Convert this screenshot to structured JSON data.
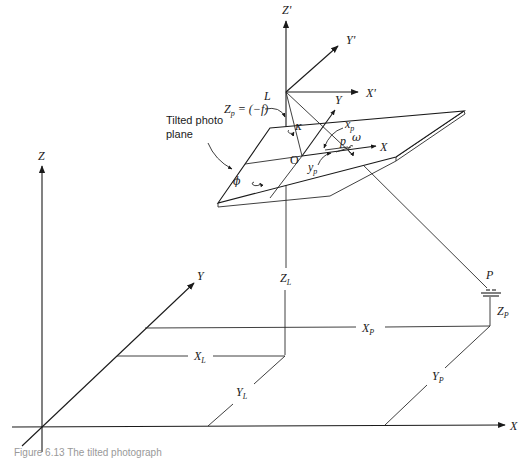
{
  "figure": {
    "callout_label_line1": "Tilted photo",
    "callout_label_line2": "plane",
    "caption": "Figure 6.13  The tilted photograph"
  },
  "ground_axes": {
    "x_label": "X",
    "y_label": "Y",
    "z_label": "Z"
  },
  "camera_axes": {
    "perspective_center": "L",
    "x_prime_label": "X'",
    "y_prime_label": "Y'",
    "z_prime_label": "Z'"
  },
  "photo_plane": {
    "focal_label_main": "Z",
    "focal_label_sub": "p",
    "focal_label_value": " = (−f)",
    "origin_label": "O",
    "image_point_label": "p",
    "x_axis_label": "X",
    "y_axis_label": "Y",
    "xp_main": "x",
    "xp_sub": "p",
    "yp_main": "y",
    "yp_sub": "p",
    "omega": "ω",
    "phi": "ϕ",
    "kappa": "κ"
  },
  "ground_point": {
    "label": "P",
    "xp_main": "X",
    "xp_sub": "P",
    "yp_main": "Y",
    "yp_sub": "P",
    "zp_main": "Z",
    "zp_sub": "P"
  },
  "camera_ground": {
    "xl_main": "X",
    "xl_sub": "L",
    "yl_main": "Y",
    "yl_sub": "L",
    "zl_main": "Z",
    "zl_sub": "L"
  }
}
